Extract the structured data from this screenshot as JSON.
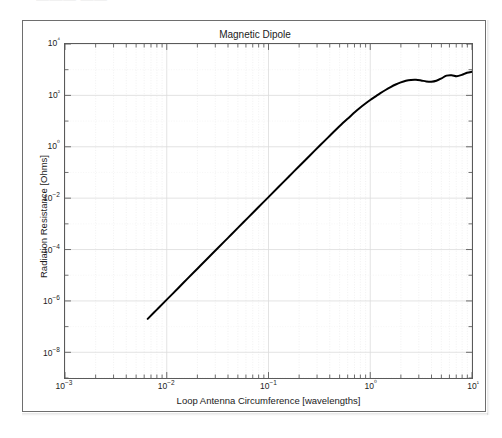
{
  "figure": {
    "top_fragment_text": "——— ——",
    "frame_color": "#6e6e6e",
    "background": "#ffffff"
  },
  "chart_data": {
    "type": "line",
    "title": "Magnetic Dipole",
    "xlabel": "Loop Antenna Circumference [wavelengths]",
    "ylabel": "Radiation Resistance [Ohms]",
    "xscale": "log",
    "yscale": "log",
    "xlim": [
      0.001,
      10
    ],
    "ylim": [
      1e-09,
      10000
    ],
    "xticks": [
      0.001,
      0.01,
      0.1,
      1,
      10
    ],
    "xtick_labels": [
      "10−3",
      "10−2",
      "10−1",
      "10⁰",
      "10¹"
    ],
    "yticks": [
      1e-08,
      1e-06,
      0.0001,
      0.01,
      1,
      100,
      10000
    ],
    "ytick_labels": [
      "10−8",
      "10−6",
      "10−4",
      "10−2",
      "10⁰",
      "10²",
      "10⁴"
    ],
    "grid": true,
    "grid_minor": true,
    "grid_color": "#e8e8e8",
    "legend": null,
    "line_color": "#000000",
    "line_width": 2.0,
    "series": [
      {
        "name": "Radiation Resistance",
        "x": [
          0.0065,
          0.008,
          0.01,
          0.013,
          0.016,
          0.02,
          0.025,
          0.032,
          0.04,
          0.05,
          0.063,
          0.079,
          0.1,
          0.126,
          0.158,
          0.2,
          0.251,
          0.316,
          0.398,
          0.501,
          0.631,
          0.708,
          0.794,
          0.891,
          1.0,
          1.122,
          1.259,
          1.413,
          1.585,
          1.778,
          1.995,
          2.239,
          2.512,
          2.818,
          3.162,
          3.548,
          3.981,
          4.467,
          5.012,
          5.623,
          6.31,
          7.079,
          7.943,
          8.913,
          10.0
        ],
        "y": [
          2e-07,
          4.6e-07,
          1.12e-06,
          3.2e-06,
          7.4e-06,
          1.8e-05,
          4.4e-05,
          0.000117,
          0.000285,
          0.000695,
          0.00175,
          0.00435,
          0.011,
          0.0278,
          0.0685,
          0.175,
          0.43,
          1.07,
          2.62,
          6.4,
          14.8,
          22.5,
          33.0,
          47.0,
          66.0,
          90.0,
          122.0,
          162.0,
          210.0,
          265.0,
          320.0,
          370.0,
          400.0,
          405.0,
          380.0,
          350.0,
          340.0,
          370.0,
          460.0,
          590.0,
          610.0,
          560.0,
          630.0,
          760.0,
          830.0
        ]
      }
    ],
    "description_notes": {
      "low_frequency_slope": "slope ~4 on log-log (R ∝ C⁴)",
      "high_frequency_behavior": "levels off near 10²–10³ Ohms with ripples above C ≈ 1"
    }
  }
}
